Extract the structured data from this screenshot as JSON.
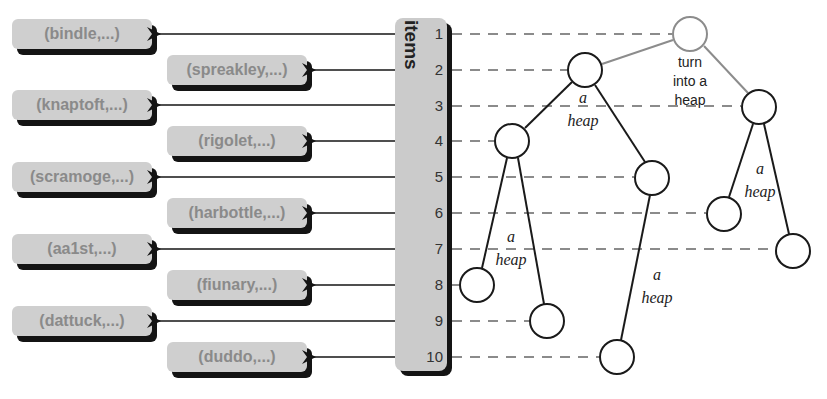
{
  "array": {
    "label": "items",
    "indices": [
      "1",
      "2",
      "3",
      "4",
      "5",
      "6",
      "7",
      "8",
      "9",
      "10"
    ]
  },
  "records": [
    {
      "index": 1,
      "label": "(bindle,...)"
    },
    {
      "index": 2,
      "label": "(spreakley,...)"
    },
    {
      "index": 3,
      "label": "(knaptoft,...)"
    },
    {
      "index": 4,
      "label": "(rigolet,...)"
    },
    {
      "index": 5,
      "label": "(scramoge,...)"
    },
    {
      "index": 6,
      "label": "(harbottle,...)"
    },
    {
      "index": 7,
      "label": "(aa1st,...)"
    },
    {
      "index": 8,
      "label": "(fiunary,...)"
    },
    {
      "index": 9,
      "label": "(dattuck,...)"
    },
    {
      "index": 10,
      "label": "(duddo,...)"
    }
  ],
  "tree": {
    "root_annotation": [
      "turn",
      "into a",
      "heap"
    ],
    "subtree_annotation": [
      "a",
      "heap"
    ],
    "colors": {
      "root_node": "#8c8c8c",
      "node": "#1a1a1a",
      "dashed": "#666666",
      "box_fill": "#cfcfcf",
      "box_text": "#8a8a8a",
      "shadow": "#141414"
    }
  }
}
